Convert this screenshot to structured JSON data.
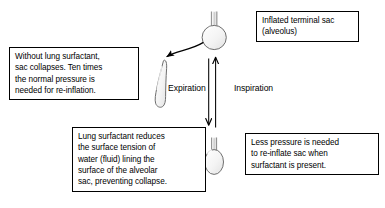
{
  "diagram": {
    "background_color": "#ffffff",
    "stroke_color": "#000000",
    "sac_fill_color": "#f2f2f2"
  },
  "callouts": {
    "inflated": {
      "text": "Inflated terminal sac\n(alveolus)",
      "name": "inflated-terminal-sac-callout"
    },
    "collapse": {
      "text": "Without lung surfactant,\nsac collapses. Ten times\nthe normal pressure is\nneeded for re-inflation.",
      "name": "collapse-callout"
    },
    "surfactant": {
      "text": "Lung surfactant reduces\nthe surface tension of\nwater (fluid) lining the\nsurface of the alveolar\nsac, preventing collapse.",
      "name": "surfactant-callout"
    },
    "pressure": {
      "text": "Less pressure is needed\nto re-inflate sac when\nsurfactant is present.",
      "name": "pressure-callout"
    }
  },
  "flow_labels": {
    "expiration": "Expiration",
    "inspiration": "Inspiration"
  },
  "shapes": {
    "inflated_sac": "round-flask-inflated-alveolus",
    "collapsed_sac": "collapsed-alveolar-sac",
    "deflated_sac": "oval-flask-deflated-alveolus",
    "curved_arrow": "curved-arrow-to-collapsed-sac",
    "down_arrow": "expiration-down-arrow",
    "up_arrow": "inspiration-up-arrow"
  }
}
